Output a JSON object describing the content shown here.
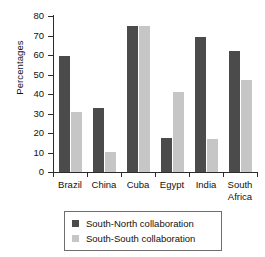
{
  "chart_data": {
    "type": "bar",
    "title": "",
    "xlabel": "",
    "ylabel": "Percentages",
    "ylim": [
      0,
      80
    ],
    "yticks": [
      0,
      10,
      20,
      30,
      40,
      50,
      60,
      70,
      80
    ],
    "ytick_labels": [
      "0",
      "10",
      "20",
      "30",
      "40",
      "50",
      "60",
      "70",
      "80"
    ],
    "grid": false,
    "legend_position": "bottom",
    "categories": [
      "Brazil",
      "China",
      "Cuba",
      "Egypt",
      "India",
      "South\nAfrica"
    ],
    "series": [
      {
        "name": "South-North collaboration",
        "color": "#4b4b4b",
        "values": [
          59.5,
          33,
          75,
          17.5,
          69,
          62
        ]
      },
      {
        "name": "South-South collaboration",
        "color": "#c6c6c6",
        "values": [
          31,
          10.5,
          75,
          41,
          17,
          47
        ]
      }
    ]
  },
  "legend": {
    "items": [
      {
        "label": "South-North collaboration",
        "swatch": "dark"
      },
      {
        "label": "South-South collaboration",
        "swatch": "light"
      }
    ]
  },
  "colors": {
    "south_north": "#4b4b4b",
    "south_south": "#c6c6c6",
    "axis": "#2b2b2b",
    "text": "#111111",
    "background": "#ffffff"
  }
}
